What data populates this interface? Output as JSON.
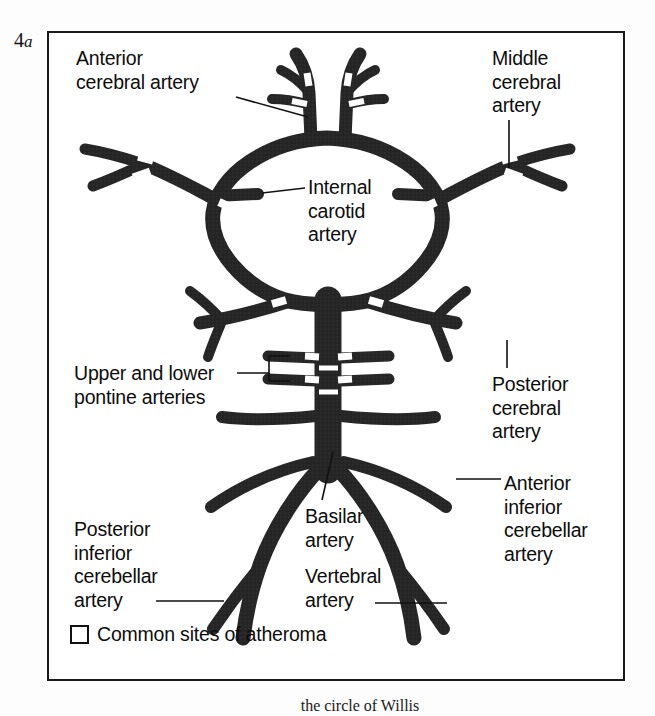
{
  "figure": {
    "number": "4",
    "sub": "a",
    "caption": "the circle of Willis"
  },
  "labels": {
    "anterior_cerebral": "Anterior\ncerebral artery",
    "middle_cerebral": "Middle\ncerebral\nartery",
    "internal_carotid": "Internal\ncarotid\nartery",
    "upper_lower_pontine": "Upper and lower\npontine arteries",
    "posterior_cerebral": "Posterior\ncerebral\nartery",
    "anterior_inferior_cerebellar": "Anterior\ninferior\ncerebellar\nartery",
    "posterior_inferior_cerebellar": "Posterior\ninferior\ncerebellar\nartery",
    "basilar": "Basilar\nartery",
    "vertebral": "Vertebral\nartery"
  },
  "legend": {
    "swatch_name": "atheroma-site-swatch",
    "text": "Common sites of atheroma"
  },
  "colors": {
    "vessel_fill": "#262626",
    "vessel_stroke": "#0d0d0d",
    "atheroma_gap": "#ffffff",
    "frame": "#1a1a1a",
    "text": "#0d0d0d",
    "background": "#ffffff"
  },
  "diagram": {
    "vessel_count": 9,
    "atheroma_marker_count": 14
  }
}
